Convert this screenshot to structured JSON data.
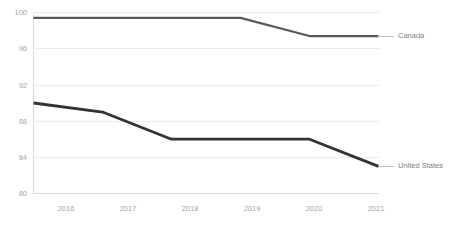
{
  "chart_data": {
    "type": "line",
    "title": "",
    "xlabel": "",
    "ylabel": "",
    "categories": [
      "2016",
      "2017",
      "2018",
      "2019",
      "2020",
      "2021"
    ],
    "x": [
      2016,
      2017,
      2018,
      2019,
      2020,
      2021
    ],
    "series": [
      {
        "name": "Canada",
        "label": "Canada",
        "color": "#595959",
        "values": [
          99.4,
          99.4,
          99.4,
          99.4,
          97.4,
          97.4
        ]
      },
      {
        "name": "United States",
        "label": "United States",
        "color": "#333333",
        "values": [
          90.0,
          89.0,
          86.0,
          86.0,
          86.0,
          83.0
        ]
      }
    ],
    "ylim": [
      80,
      100
    ],
    "y_ticks": [
      80,
      84,
      88,
      92,
      96,
      100
    ],
    "y_tick_labels": [
      "80",
      "84",
      "88",
      "92",
      "96",
      "100"
    ],
    "x_tick_labels": [
      "2016",
      "2017",
      "2018",
      "2019",
      "2020",
      "2021"
    ],
    "grid": true,
    "grid_axis": "y",
    "legend_position": "right-direct-labels",
    "background_color": "#ffffff",
    "gridline_color": "#ebebeb",
    "axis_color": "#d9d9d9",
    "tick_label_color": "#a6a6a6",
    "series_label_color": "#7f7f7f"
  },
  "axis": {
    "y_labels": [
      "100",
      "96",
      "92",
      "88",
      "84",
      "80"
    ],
    "x_labels": [
      "2016",
      "2017",
      "2018",
      "2019",
      "2020",
      "2021"
    ]
  },
  "labels": {
    "canada": "Canada",
    "united_states": "United States"
  }
}
